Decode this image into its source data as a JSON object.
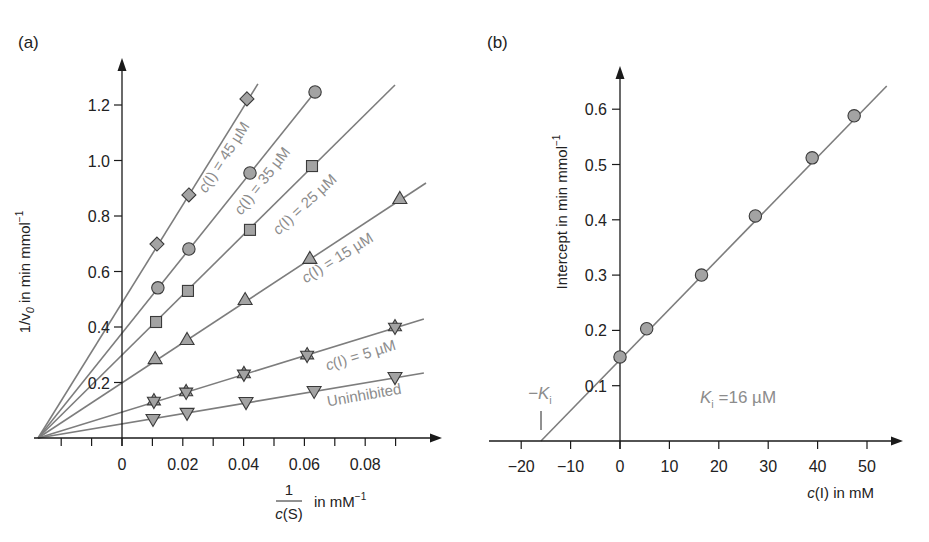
{
  "chart_data": [
    {
      "panel": "(a)",
      "type": "line",
      "title": "",
      "xlabel": "1/c(S) in mM⁻¹",
      "xlabel_parts": {
        "numerator": "1",
        "denominator": "c(S)",
        "unit": "in mM⁻¹"
      },
      "ylabel": "1/v₀ in min mmol⁻¹",
      "xlim": [
        -0.03,
        0.105
      ],
      "ylim": [
        0,
        1.35
      ],
      "xticks": [
        -0.02,
        -0.01,
        0,
        0.01,
        0.02,
        0.03,
        0.04,
        0.05,
        0.06,
        0.07,
        0.08,
        0.09
      ],
      "xticklabels": [
        {
          "value": 0,
          "label": "0"
        },
        {
          "value": 0.02,
          "label": "0.02"
        },
        {
          "value": 0.04,
          "label": "0.04"
        },
        {
          "value": 0.06,
          "label": "0.06"
        },
        {
          "value": 0.08,
          "label": "0.08"
        }
      ],
      "yticks": [
        {
          "value": 0.2,
          "label": "0.2"
        },
        {
          "value": 0.4,
          "label": "0.4"
        },
        {
          "value": 0.6,
          "label": "0.6"
        },
        {
          "value": 0.8,
          "label": "0.8"
        },
        {
          "value": 1.0,
          "label": "1.0"
        },
        {
          "value": 1.2,
          "label": "1.2"
        }
      ],
      "grid": false,
      "convergence_point": [
        -0.0276,
        0
      ],
      "series": [
        {
          "name": "Uninhibited",
          "label": "Uninhibited",
          "marker": "triangle-down",
          "x": [
            0.0102,
            0.0214,
            0.0408,
            0.0632,
            0.0898
          ],
          "y": [
            0.065,
            0.087,
            0.126,
            0.166,
            0.216
          ],
          "line_end": [
            0.0993,
            0.234
          ],
          "label_pos": [
            365,
            400
          ],
          "label_angle": -10
        },
        {
          "name": "c(I) = 5 µM",
          "label": "c(I) = 5 µM",
          "marker": "star",
          "x": [
            0.0105,
            0.0211,
            0.0401,
            0.0609,
            0.0898
          ],
          "y": [
            0.133,
            0.166,
            0.231,
            0.299,
            0.4
          ],
          "line_end": [
            0.0993,
            0.429
          ],
          "label_pos": [
            362,
            360
          ],
          "label_angle": -17
        },
        {
          "name": "c(I) = 15 µM",
          "label": "c(I) = 15 µM",
          "marker": "triangle-up",
          "x": [
            0.0109,
            0.0214,
            0.0405,
            0.0618,
            0.0914
          ],
          "y": [
            0.288,
            0.357,
            0.501,
            0.649,
            0.865
          ],
          "line_end": [
            0.1,
            0.919
          ],
          "label_pos": [
            340,
            262
          ],
          "label_angle": -32
        },
        {
          "name": "c(I) = 25 µM",
          "label": "c(I) = 25 µM",
          "marker": "square",
          "x": [
            0.0112,
            0.0217,
            0.0421,
            0.0625
          ],
          "y": [
            0.418,
            0.53,
            0.75,
            0.98
          ],
          "line_end": [
            0.0898,
            1.272
          ],
          "label_pos": [
            308,
            208
          ],
          "label_angle": -43
        },
        {
          "name": "c(I) = 35 µM",
          "label": "c(I) = 35 µM",
          "marker": "circle",
          "x": [
            0.0118,
            0.022,
            0.0421,
            0.0635
          ],
          "y": [
            0.541,
            0.681,
            0.955,
            1.247
          ],
          "line_end": [
            0.0635,
            1.247
          ],
          "label_pos": [
            266,
            184
          ],
          "label_angle": -52
        },
        {
          "name": "c(I) = 45 µM",
          "label": "c(I) = 45 µM",
          "marker": "diamond",
          "x": [
            0.0115,
            0.022,
            0.0411
          ],
          "y": [
            0.699,
            0.876,
            1.222
          ],
          "line_end": [
            0.0447,
            1.276
          ],
          "label_pos": [
            228,
            160
          ],
          "label_angle": -57
        }
      ]
    },
    {
      "panel": "(b)",
      "type": "scatter",
      "title": "",
      "xlabel": "c(I) in mM",
      "ylabel": "Intercept in min mmol⁻¹",
      "xlim": [
        -27,
        57
      ],
      "ylim": [
        0,
        0.67
      ],
      "xticks": [
        {
          "value": -20,
          "label": "−20"
        },
        {
          "value": -10,
          "label": "−10"
        },
        {
          "value": 0,
          "label": "0"
        },
        {
          "value": 10,
          "label": "10"
        },
        {
          "value": 20,
          "label": "20"
        },
        {
          "value": 30,
          "label": "30"
        },
        {
          "value": 40,
          "label": "40"
        },
        {
          "value": 50,
          "label": "50"
        }
      ],
      "yticks": [
        {
          "value": 0.1,
          "label": "0.1"
        },
        {
          "value": 0.2,
          "label": "0.2"
        },
        {
          "value": 0.3,
          "label": "0.3"
        },
        {
          "value": 0.4,
          "label": "0.4"
        },
        {
          "value": 0.5,
          "label": "0.5"
        },
        {
          "value": 0.6,
          "label": "0.6"
        }
      ],
      "grid": false,
      "series": [
        {
          "name": "Intercepts",
          "marker": "circle",
          "x": [
            0,
            5.4,
            16.5,
            27.4,
            38.9,
            47.4
          ],
          "y": [
            0.152,
            0.203,
            0.3,
            0.407,
            0.512,
            0.588
          ]
        }
      ],
      "fit_line": {
        "x": [
          -16,
          54
        ],
        "y": [
          0,
          0.642
        ]
      },
      "annotations": [
        {
          "text": "−K",
          "sub": "i",
          "role": "x-intercept marker",
          "x": -16
        },
        {
          "text": "K",
          "sub": "i",
          "suffix": " =16 µM",
          "role": "result"
        }
      ]
    }
  ],
  "labels": {
    "panel_a": "(a)",
    "panel_b": "(b)",
    "a_ylabel_prefix": "1/v",
    "a_ylabel_sub": "0",
    "a_ylabel_suffix": " in min mmol",
    "a_ylabel_sup": "−1",
    "a_xlabel_num": "1",
    "a_xlabel_den_c": "c",
    "a_xlabel_den_rest": "(S)",
    "a_xlabel_unit": "in mM",
    "a_xlabel_sup": "−1",
    "b_ylabel": "Intercept in min mmol",
    "b_ylabel_sup": "−1",
    "b_xlabel_c": "c",
    "b_xlabel_rest": "(I) in mM",
    "neg_ki_K": "−K",
    "neg_ki_sub": "i",
    "ki_K": "K",
    "ki_sub": "i",
    "ki_value": " =16 µM"
  },
  "colors": {
    "line": "#7d7d7d",
    "marker_fill": "#a3a3a3",
    "marker_stroke": "#3a3a3a",
    "series_label": "#8c8c8c",
    "axis": "#1a1a1a"
  }
}
